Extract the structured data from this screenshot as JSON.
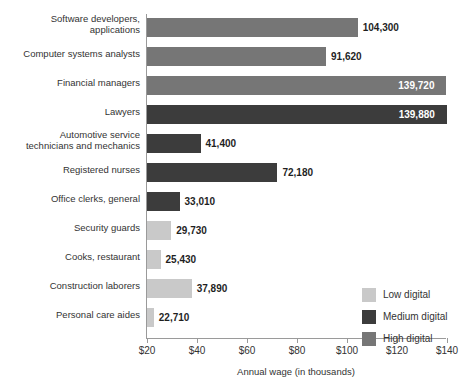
{
  "figure": {
    "clipped_title": "FIGURE 10"
  },
  "chart_data": {
    "type": "bar",
    "orientation": "horizontal",
    "title": "",
    "xlabel": "Annual wage (in thousands)",
    "ylabel": "",
    "xlim": [
      20,
      140
    ],
    "xticks": [
      20,
      40,
      60,
      80,
      100,
      120,
      140
    ],
    "xtick_labels": [
      "$20",
      "$40",
      "$60",
      "$80",
      "$100",
      "$120",
      "$140"
    ],
    "grid": false,
    "legend_position": "bottom-right",
    "legend": [
      {
        "label": "Low digital",
        "color": "#c9c9c9"
      },
      {
        "label": "Medium digital",
        "color": "#3c3c3c"
      },
      {
        "label": "High digital",
        "color": "#767676"
      }
    ],
    "categories": [
      "Software developers, applications",
      "Computer systems analysts",
      "Financial managers",
      "Lawyers",
      "Automotive service technicians and mechanics",
      "Registered nurses",
      "Office clerks, general",
      "Security guards",
      "Cooks, restaurant",
      "Construction laborers",
      "Personal care aides"
    ],
    "values": [
      104300,
      91620,
      139720,
      139880,
      41400,
      72180,
      33010,
      29730,
      25430,
      37890,
      22710
    ],
    "value_labels": [
      "104,300",
      "91,620",
      "139,720",
      "139,880",
      "41,400",
      "72,180",
      "33,010",
      "29,730",
      "25,430",
      "37,890",
      "22,710"
    ],
    "groups": [
      "high",
      "high",
      "high",
      "medium",
      "medium",
      "medium",
      "medium",
      "low",
      "low",
      "low",
      "low"
    ],
    "bars": [
      {
        "category_lines": [
          "Software developers,",
          "applications"
        ],
        "value": 104300,
        "value_label": "104,300",
        "group": "high",
        "label_placement": "outside"
      },
      {
        "category_lines": [
          "Computer systems analysts"
        ],
        "value": 91620,
        "value_label": "91,620",
        "group": "high",
        "label_placement": "outside"
      },
      {
        "category_lines": [
          "Financial managers"
        ],
        "value": 139720,
        "value_label": "139,720",
        "group": "high",
        "label_placement": "inside"
      },
      {
        "category_lines": [
          "Lawyers"
        ],
        "value": 139880,
        "value_label": "139,880",
        "group": "medium",
        "label_placement": "inside"
      },
      {
        "category_lines": [
          "Automotive service",
          "technicians and mechanics"
        ],
        "value": 41400,
        "value_label": "41,400",
        "group": "medium",
        "label_placement": "outside"
      },
      {
        "category_lines": [
          "Registered nurses"
        ],
        "value": 72180,
        "value_label": "72,180",
        "group": "medium",
        "label_placement": "outside"
      },
      {
        "category_lines": [
          "Office clerks, general"
        ],
        "value": 33010,
        "value_label": "33,010",
        "group": "medium",
        "label_placement": "outside"
      },
      {
        "category_lines": [
          "Security guards"
        ],
        "value": 29730,
        "value_label": "29,730",
        "group": "low",
        "label_placement": "outside"
      },
      {
        "category_lines": [
          "Cooks, restaurant"
        ],
        "value": 25430,
        "value_label": "25,430",
        "group": "low",
        "label_placement": "outside"
      },
      {
        "category_lines": [
          "Construction laborers"
        ],
        "value": 37890,
        "value_label": "37,890",
        "group": "low",
        "label_placement": "outside"
      },
      {
        "category_lines": [
          "Personal care aides"
        ],
        "value": 22710,
        "value_label": "22,710",
        "group": "low",
        "label_placement": "outside"
      }
    ]
  },
  "colors": {
    "low_digital": "#c9c9c9",
    "medium_digital": "#3c3c3c",
    "high_digital": "#767676",
    "axis": "#9a9a9a",
    "text": "#333333",
    "background": "#ffffff"
  }
}
